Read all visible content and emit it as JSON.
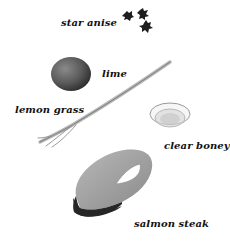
{
  "ingredients": [
    {
      "id": "star-anise",
      "label": "star anise",
      "icon": "star-anise-icon"
    },
    {
      "id": "lime",
      "label": "lime",
      "icon": "lime-icon"
    },
    {
      "id": "lemon-grass",
      "label": "lemon grass",
      "icon": "lemon-grass-icon"
    },
    {
      "id": "clear-honey",
      "label": "clear boney",
      "icon": "honey-bowl-icon"
    },
    {
      "id": "salmon-steak",
      "label": "salmon steak",
      "icon": "salmon-steak-icon"
    }
  ],
  "colors": {
    "background": "#ffffff",
    "text": "#111111",
    "star_anise": "#1e1e1e",
    "lime": "#5a5a5a",
    "salmon_flesh": "#9a9a9a",
    "salmon_skin": "#2a2a2a"
  }
}
